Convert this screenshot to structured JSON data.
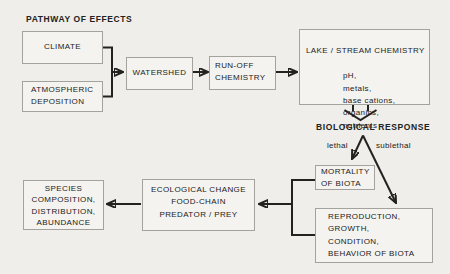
{
  "title": "PATHWAY OF EFFECTS",
  "boxes": {
    "climate": {
      "label": "CLIMATE"
    },
    "atmospheric": {
      "label": "ATMOSPHERIC\nDEPOSITION"
    },
    "watershed": {
      "label": "WATERSHED"
    },
    "runoff": {
      "label": "RUN-OFF\nCHEMISTRY"
    },
    "lake": {
      "title": "LAKE / STREAM CHEMISTRY",
      "items": "pH,\nmetals,\nbase cations,\norganics,\nnutrients"
    },
    "mortality": {
      "label": "MORTALITY\nOF BIOTA"
    },
    "reproduction": {
      "label": "REPRODUCTION,\nGROWTH,\nCONDITION,\nBEHAVIOR OF BIOTA"
    },
    "ecological": {
      "label": "ECOLOGICAL CHANGE\nFOOD-CHAIN\nPREDATOR / PREY"
    },
    "species": {
      "label": "SPECIES\nCOMPOSITION,\nDISTRIBUTION,\nABUNDANCE"
    }
  },
  "labels": {
    "biological_response": "BIOLOGICAL RESPONSE",
    "lethal": "lethal",
    "sublethal": "sublethal"
  },
  "colors": {
    "background": "#efeeea",
    "box_border": "#a3a29d",
    "ink": "#222220"
  }
}
